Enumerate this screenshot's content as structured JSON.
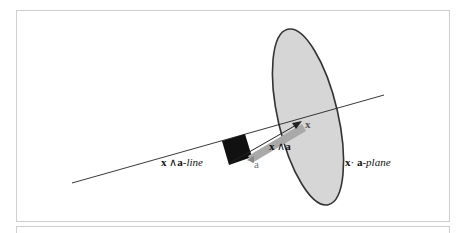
{
  "diagram": {
    "labels": {
      "line_label": {
        "x": "x",
        "op": "∧",
        "a": "a",
        "suffix": "-line"
      },
      "plane_label": {
        "x": "x",
        "op": "·",
        "a": "a",
        "suffix": "-plane"
      },
      "point_x": "x",
      "vector_a": "a",
      "bivector": {
        "x": "x",
        "op": "∧",
        "a": "a"
      }
    },
    "colors": {
      "plane_fill": "#d6d6d6",
      "plane_stroke": "#333333",
      "square_fill": "#111111",
      "arrow_fill": "#a9a9a9",
      "line": "#222222"
    }
  }
}
